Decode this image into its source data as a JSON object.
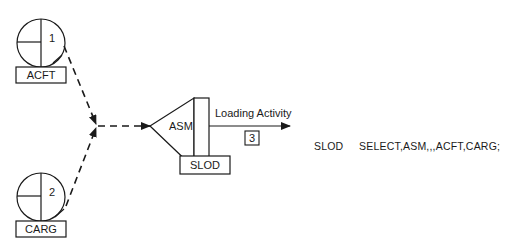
{
  "diagram": {
    "queues": [
      {
        "id": "1",
        "label": "ACFT"
      },
      {
        "id": "2",
        "label": "CARG"
      }
    ],
    "assemble_node": {
      "label": "ASM",
      "block_label": "SLOD"
    },
    "activity": {
      "label": "Loading Activity",
      "number": "3"
    },
    "statement": {
      "label": "SLOD",
      "code": "SELECT,ASM,,,ACFT,CARG;"
    }
  },
  "colors": {
    "ink": "#1a1a1a",
    "background": "#ffffff"
  }
}
